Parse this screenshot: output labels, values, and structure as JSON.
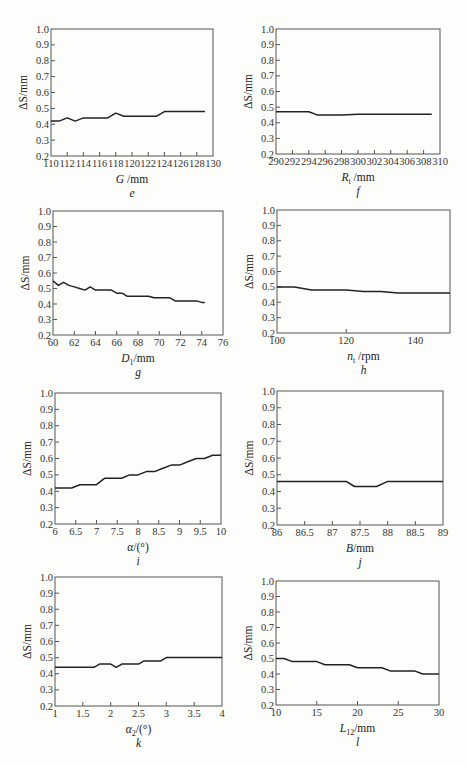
{
  "figure": {
    "panels": [
      "e",
      "f",
      "g",
      "h",
      "i",
      "j",
      "k",
      "l"
    ]
  },
  "chart_data": [
    {
      "id": "e",
      "type": "line",
      "panel_label": "e",
      "ylabel": "ΔS/mm",
      "xlabel": "G /mm",
      "xlabel_var": "G",
      "xlabel_sub": "",
      "xlabel_unit": " /mm",
      "xlim": [
        110,
        130
      ],
      "ylim": [
        0.2,
        1.0
      ],
      "xticks": [
        110,
        112,
        114,
        116,
        118,
        120,
        122,
        124,
        126,
        128,
        130
      ],
      "xtick_labels": [
        "110",
        "112",
        "114",
        "116",
        "118",
        "120",
        "122",
        "124",
        "126",
        "128",
        "130"
      ],
      "yticks": [
        0.2,
        0.3,
        0.4,
        0.5,
        0.6,
        0.7,
        0.8,
        0.9,
        1.0
      ],
      "ytick_labels": [
        "0.2",
        "0.3",
        "0.4",
        "0.5",
        "0.6",
        "0.7",
        "0.8",
        "0.9",
        "1.0"
      ],
      "grid": false,
      "box": {
        "left": 51,
        "top": 29,
        "right": 213,
        "bottom": 156
      },
      "x": [
        110,
        111,
        112,
        113,
        114,
        115,
        116,
        117,
        118,
        119,
        120,
        121,
        122,
        123,
        124,
        125,
        126,
        127,
        128,
        129
      ],
      "values": [
        0.42,
        0.42,
        0.44,
        0.42,
        0.44,
        0.44,
        0.44,
        0.44,
        0.47,
        0.45,
        0.45,
        0.45,
        0.45,
        0.45,
        0.48,
        0.48,
        0.48,
        0.48,
        0.48,
        0.48
      ]
    },
    {
      "id": "f",
      "type": "line",
      "panel_label": "f",
      "ylabel": "ΔS/mm",
      "xlabel": "Rt /mm",
      "xlabel_var": "R",
      "xlabel_sub": "t",
      "xlabel_unit": " /mm",
      "xlim": [
        290,
        310
      ],
      "ylim": [
        0.2,
        1.0
      ],
      "xticks": [
        290,
        292,
        294,
        296,
        298,
        300,
        302,
        304,
        306,
        308,
        310
      ],
      "xtick_labels": [
        "290",
        "292",
        "294",
        "296",
        "298",
        "300",
        "302",
        "304",
        "306",
        "308",
        "310"
      ],
      "yticks": [
        0.2,
        0.3,
        0.4,
        0.5,
        0.6,
        0.7,
        0.8,
        0.9,
        1.0
      ],
      "ytick_labels": [
        "0.2",
        "0.3",
        "0.4",
        "0.5",
        "0.6",
        "0.7",
        "0.8",
        "0.9",
        "1.0"
      ],
      "grid": false,
      "box": {
        "left": 276,
        "top": 29,
        "right": 440,
        "bottom": 154
      },
      "x": [
        290,
        292,
        294,
        295,
        296,
        298,
        300,
        302,
        304,
        306,
        308,
        309
      ],
      "values": [
        0.47,
        0.47,
        0.47,
        0.45,
        0.45,
        0.45,
        0.455,
        0.455,
        0.455,
        0.455,
        0.455,
        0.455
      ]
    },
    {
      "id": "g",
      "type": "line",
      "panel_label": "g",
      "ylabel": "ΔS/mm",
      "xlabel": "D1/mm",
      "xlabel_var": "D",
      "xlabel_sub": "1",
      "xlabel_unit": "/mm",
      "xlim": [
        60,
        76
      ],
      "ylim": [
        0.2,
        1.0
      ],
      "xticks": [
        60,
        62,
        64,
        66,
        68,
        70,
        72,
        74,
        76
      ],
      "xtick_labels": [
        "60",
        "62",
        "64",
        "66",
        "68",
        "70",
        "72",
        "74",
        "76"
      ],
      "yticks": [
        0.2,
        0.3,
        0.4,
        0.5,
        0.6,
        0.7,
        0.8,
        0.9,
        1.0
      ],
      "ytick_labels": [
        "0.2",
        "0.3",
        "0.4",
        "0.5",
        "0.6",
        "0.7",
        "0.8",
        "0.9",
        "1.0"
      ],
      "grid": false,
      "box": {
        "left": 53,
        "top": 211,
        "right": 223,
        "bottom": 335
      },
      "x": [
        60,
        60.5,
        61,
        61.5,
        62,
        62.5,
        63,
        63.5,
        64,
        64.5,
        65,
        65.5,
        66,
        66.5,
        67,
        67.5,
        68,
        68.5,
        69,
        69.5,
        70,
        70.5,
        71,
        71.5,
        72,
        72.5,
        73,
        73.5,
        74,
        74.3
      ],
      "values": [
        0.55,
        0.52,
        0.54,
        0.52,
        0.51,
        0.5,
        0.49,
        0.51,
        0.49,
        0.49,
        0.49,
        0.49,
        0.47,
        0.47,
        0.45,
        0.45,
        0.45,
        0.45,
        0.45,
        0.44,
        0.44,
        0.44,
        0.44,
        0.42,
        0.42,
        0.42,
        0.42,
        0.42,
        0.41,
        0.41
      ]
    },
    {
      "id": "h",
      "type": "line",
      "panel_label": "h",
      "ylabel": "ΔS/mm",
      "xlabel": "nt /rpm",
      "xlabel_var": "n",
      "xlabel_sub": "t",
      "xlabel_unit": " /rpm",
      "xlim": [
        100,
        150
      ],
      "ylim": [
        0.2,
        1.0
      ],
      "xticks": [
        100,
        120,
        140
      ],
      "xtick_labels": [
        "100",
        "120",
        "140"
      ],
      "yticks": [
        0.2,
        0.3,
        0.4,
        0.5,
        0.6,
        0.7,
        0.8,
        0.9,
        1.0
      ],
      "ytick_labels": [
        "0.2",
        "0.3",
        "0.4",
        "0.5",
        "0.6",
        "0.7",
        "0.8",
        "0.9",
        "1.0"
      ],
      "grid": false,
      "box": {
        "left": 277,
        "top": 210,
        "right": 450,
        "bottom": 333
      },
      "x": [
        100,
        105,
        110,
        115,
        120,
        125,
        130,
        135,
        140,
        145,
        150
      ],
      "values": [
        0.5,
        0.5,
        0.48,
        0.48,
        0.48,
        0.47,
        0.47,
        0.46,
        0.46,
        0.46,
        0.46
      ]
    },
    {
      "id": "i",
      "type": "line",
      "panel_label": "i",
      "ylabel": "ΔS/mm",
      "xlabel": "α/(°)",
      "xlabel_var": "α",
      "xlabel_sub": "",
      "xlabel_unit": "/(°)",
      "xlim": [
        6,
        10
      ],
      "ylim": [
        0.2,
        1.0
      ],
      "xticks": [
        6,
        6.5,
        7,
        7.5,
        8,
        8.5,
        9,
        9.5,
        10
      ],
      "xtick_labels": [
        "6",
        "6.5",
        "7",
        "7.5",
        "8",
        "8.5",
        "9",
        "9.5",
        "10"
      ],
      "yticks": [
        0.2,
        0.3,
        0.4,
        0.5,
        0.6,
        0.7,
        0.8,
        0.9,
        1.0
      ],
      "ytick_labels": [
        "0.2",
        "0.3",
        "0.4",
        "0.5",
        "0.6",
        "0.7",
        "0.8",
        "0.9",
        "1.0"
      ],
      "grid": false,
      "box": {
        "left": 55,
        "top": 393,
        "right": 221,
        "bottom": 524
      },
      "x": [
        6,
        6.4,
        6.6,
        7,
        7.2,
        7.6,
        7.8,
        8,
        8.2,
        8.4,
        8.6,
        8.8,
        9,
        9.2,
        9.4,
        9.6,
        9.8,
        10
      ],
      "values": [
        0.42,
        0.42,
        0.44,
        0.44,
        0.48,
        0.48,
        0.5,
        0.5,
        0.52,
        0.52,
        0.54,
        0.56,
        0.56,
        0.58,
        0.6,
        0.6,
        0.62,
        0.62
      ]
    },
    {
      "id": "j",
      "type": "line",
      "panel_label": "j",
      "ylabel": "ΔS/mm",
      "xlabel": "B/mm",
      "xlabel_var": "B",
      "xlabel_sub": "",
      "xlabel_unit": "/mm",
      "xlim": [
        86,
        89
      ],
      "ylim": [
        0.2,
        1.0
      ],
      "xticks": [
        86,
        86.5,
        87,
        87.5,
        88,
        88.5,
        89
      ],
      "xtick_labels": [
        "86",
        "86.5",
        "87",
        "87.5",
        "88",
        "88.5",
        "89"
      ],
      "yticks": [
        0.2,
        0.3,
        0.4,
        0.5,
        0.6,
        0.7,
        0.8,
        0.9,
        1.0
      ],
      "ytick_labels": [
        "0.2",
        "0.3",
        "0.4",
        "0.5",
        "0.6",
        "0.7",
        "0.8",
        "0.9",
        "1.0"
      ],
      "grid": false,
      "box": {
        "left": 277,
        "top": 391,
        "right": 443,
        "bottom": 525
      },
      "x": [
        86,
        86.5,
        87,
        87.25,
        87.4,
        87.5,
        87.8,
        88,
        88.5,
        89
      ],
      "values": [
        0.46,
        0.46,
        0.46,
        0.46,
        0.43,
        0.43,
        0.43,
        0.46,
        0.46,
        0.46
      ]
    },
    {
      "id": "k",
      "type": "line",
      "panel_label": "k",
      "ylabel": "ΔS/mm",
      "xlabel": "α2/(°)",
      "xlabel_var": "α",
      "xlabel_sub": "2",
      "xlabel_unit": "/(°)",
      "xlim": [
        1,
        4
      ],
      "ylim": [
        0.2,
        1.0
      ],
      "xticks": [
        1,
        1.5,
        2,
        2.5,
        3,
        3.5,
        4
      ],
      "xtick_labels": [
        "1",
        "1.5",
        "2",
        "2.5",
        "3",
        "3.5",
        "4"
      ],
      "yticks": [
        0.2,
        0.3,
        0.4,
        0.5,
        0.6,
        0.7,
        0.8,
        0.9,
        1.0
      ],
      "ytick_labels": [
        "0.2",
        "0.3",
        "0.4",
        "0.5",
        "0.6",
        "0.7",
        "0.8",
        "0.9",
        "1.0"
      ],
      "grid": false,
      "box": {
        "left": 55,
        "top": 577,
        "right": 222,
        "bottom": 706
      },
      "x": [
        1,
        1.5,
        1.7,
        1.8,
        2,
        2.1,
        2.2,
        2.5,
        2.6,
        2.9,
        3,
        3.5,
        4
      ],
      "values": [
        0.44,
        0.44,
        0.44,
        0.46,
        0.46,
        0.44,
        0.46,
        0.46,
        0.48,
        0.48,
        0.5,
        0.5,
        0.5
      ]
    },
    {
      "id": "l",
      "type": "line",
      "panel_label": "l",
      "ylabel": "ΔS/mm",
      "xlabel": "L12/mm",
      "xlabel_var": "L",
      "xlabel_sub": "12",
      "xlabel_unit": "/mm",
      "xlim": [
        10,
        30
      ],
      "ylim": [
        0.2,
        1.0
      ],
      "xticks": [
        10,
        15,
        20,
        25,
        30
      ],
      "xtick_labels": [
        "10",
        "15",
        "20",
        "25",
        "30"
      ],
      "yticks": [
        0.2,
        0.3,
        0.4,
        0.5,
        0.6,
        0.7,
        0.8,
        0.9,
        1.0
      ],
      "ytick_labels": [
        "0.2",
        "0.3",
        "0.4",
        "0.5",
        "0.6",
        "0.7",
        "0.8",
        "0.9",
        "1.0"
      ],
      "grid": false,
      "box": {
        "left": 276,
        "top": 581,
        "right": 439,
        "bottom": 705
      },
      "x": [
        10,
        11,
        12,
        15,
        16,
        19,
        20,
        23,
        24,
        27,
        28,
        30
      ],
      "values": [
        0.5,
        0.5,
        0.48,
        0.48,
        0.46,
        0.46,
        0.44,
        0.44,
        0.42,
        0.42,
        0.4,
        0.4
      ]
    }
  ]
}
